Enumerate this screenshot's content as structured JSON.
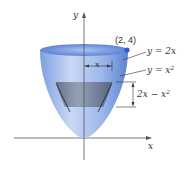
{
  "diagram": {
    "axes": {
      "x_label": "x",
      "y_label": "y"
    },
    "point": {
      "label": "(2, 4)",
      "color": "#2a5bd7"
    },
    "curves": [
      {
        "label_lhs": "y = 2x",
        "text": "y = 2x"
      },
      {
        "label_base": "y = x",
        "label_exp": "2"
      }
    ],
    "radius_label": "x",
    "height_label": {
      "base": "2x − x",
      "exp": "2"
    },
    "colors": {
      "bowl": "#8fb0e6",
      "bowl_dark": "#5f83cc",
      "rim": "#6d93dc",
      "band": "#6b7890",
      "axis": "#555555"
    }
  }
}
